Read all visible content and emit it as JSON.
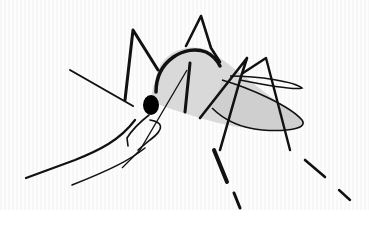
{
  "image": {
    "subject": "mosquito line-art illustration",
    "colors": {
      "background": "#ffffff",
      "background_band": "#f8f8f8",
      "ink": "#111111",
      "body_fill": "#d9d9d9",
      "wing_fill": "#cfcfcf"
    }
  }
}
